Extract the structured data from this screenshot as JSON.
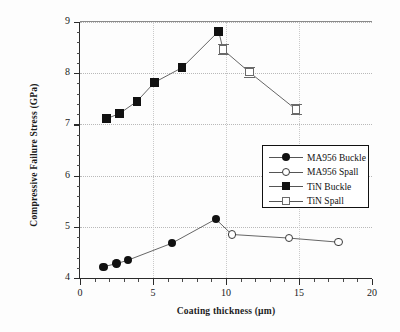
{
  "chart_data": {
    "type": "scatter",
    "title": "",
    "xlabel": "Coating thickness (µm)",
    "ylabel": "Compressive Failure Stress (GPa)",
    "xlim": [
      0,
      20
    ],
    "ylim": [
      4,
      9
    ],
    "xticks": [
      0,
      5,
      10,
      15,
      20
    ],
    "yticks": [
      4,
      5,
      6,
      7,
      8,
      9
    ],
    "xtick_labels": [
      "0",
      "5",
      "10",
      "15",
      "20"
    ],
    "ytick_labels": [
      "4",
      "5",
      "6",
      "7",
      "8",
      "9"
    ],
    "grid": true,
    "grid_style": "dotted",
    "legend_position": "center-right",
    "series": [
      {
        "name": "MA956 Buckle",
        "marker": "filled-circle",
        "color": "#111111",
        "x": [
          1.6,
          2.5,
          3.3,
          6.3,
          9.3
        ],
        "y": [
          4.22,
          4.28,
          4.35,
          4.68,
          5.15
        ]
      },
      {
        "name": "MA956 Spall",
        "marker": "open-circle",
        "color": "#333333",
        "x": [
          10.4,
          14.3,
          17.7
        ],
        "y": [
          4.85,
          4.78,
          4.7
        ]
      },
      {
        "name": "TiN Buckle",
        "marker": "filled-square",
        "color": "#111111",
        "x": [
          1.8,
          2.7,
          3.9,
          5.1,
          7.0,
          9.5
        ],
        "y": [
          7.11,
          7.21,
          7.45,
          7.82,
          8.11,
          8.82
        ]
      },
      {
        "name": "TiN Spall",
        "marker": "open-square-errorbar",
        "color": "#6a6a6a",
        "x": [
          9.8,
          11.6,
          14.8
        ],
        "y": [
          8.46,
          8.02,
          7.29
        ]
      }
    ]
  },
  "legend": {
    "entries": [
      {
        "label": "MA956 Buckle",
        "marker": "filled-circle"
      },
      {
        "label": "MA956 Spall",
        "marker": "open-circle"
      },
      {
        "label": "TiN Buckle",
        "marker": "filled-square"
      },
      {
        "label": "TiN Spall",
        "marker": "open-square-errorbar"
      }
    ]
  },
  "axes": {
    "x_title": "Coating thickness (µm)",
    "y_title": "Compressive Failure Stress (GPa)"
  }
}
